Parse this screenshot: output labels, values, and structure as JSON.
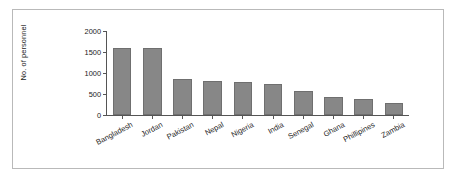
{
  "chart_data": {
    "type": "bar",
    "title": "",
    "xlabel": "",
    "ylabel": "No. of personnel",
    "ylim": [
      0,
      2000
    ],
    "yticks": [
      0,
      500,
      1000,
      1500,
      2000
    ],
    "ytick_labels": [
      "0",
      "500",
      "1000",
      "1500",
      "2000"
    ],
    "grid": false,
    "legend": "none",
    "categories": [
      "Bangladesh",
      "Jordan",
      "Pakistan",
      "Nepal",
      "Nigeria",
      "India",
      "Senegal",
      "Ghana",
      "Phillipines",
      "Zambia"
    ],
    "values": [
      1600,
      1600,
      860,
      800,
      790,
      730,
      570,
      430,
      390,
      290
    ],
    "bar_color": "#878787",
    "bar_edge_color": "#6f6f6f",
    "axis_color": "#555555",
    "frame_color": "#b9b9b9",
    "text_color": "#1a1a1a"
  }
}
